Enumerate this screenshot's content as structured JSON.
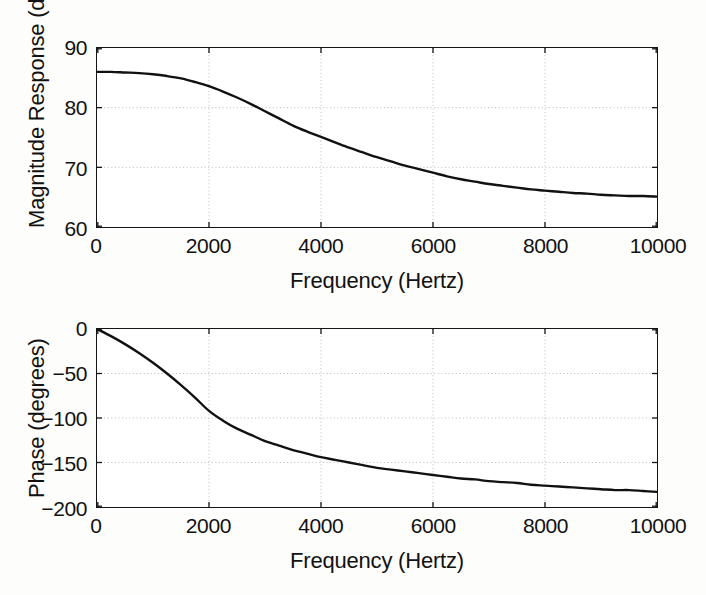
{
  "figure": {
    "background_color": "#fdfdfc",
    "axes_color": "#141414",
    "grid_color": "#b9b9b9",
    "curve_color": "#111111"
  },
  "chart_data": [
    {
      "type": "line",
      "id": "magnitude-response",
      "title": "",
      "xlabel": "Frequency (Hertz)",
      "ylabel": "Magnitude Response (dB)",
      "xlim": [
        0,
        10000
      ],
      "ylim": [
        60,
        90
      ],
      "xticks": [
        0,
        2000,
        4000,
        6000,
        8000,
        10000
      ],
      "xticklabels": [
        "0",
        "2000",
        "4000",
        "6000",
        "8000",
        "10000"
      ],
      "yticks": [
        60,
        70,
        80,
        90
      ],
      "yticklabels": [
        "60",
        "70",
        "80",
        "90"
      ],
      "grid": true,
      "legend": null,
      "series": [
        {
          "name": "Magnitude Response",
          "x": [
            0,
            250,
            500,
            750,
            1000,
            1250,
            1500,
            1750,
            2000,
            2250,
            2500,
            2750,
            3000,
            3250,
            3500,
            3750,
            4000,
            4250,
            4500,
            4750,
            5000,
            5250,
            5500,
            5750,
            6000,
            6250,
            6500,
            6750,
            7000,
            7250,
            7500,
            7750,
            8000,
            8250,
            8500,
            8750,
            9000,
            9250,
            9500,
            9750,
            10000
          ],
          "values": [
            86.0,
            86.0,
            85.9,
            85.8,
            85.6,
            85.3,
            84.9,
            84.3,
            83.6,
            82.7,
            81.7,
            80.6,
            79.4,
            78.2,
            77.0,
            76.0,
            75.1,
            74.2,
            73.3,
            72.5,
            71.7,
            71.0,
            70.3,
            69.7,
            69.1,
            68.5,
            68.0,
            67.6,
            67.2,
            66.9,
            66.6,
            66.3,
            66.1,
            65.9,
            65.7,
            65.6,
            65.4,
            65.3,
            65.2,
            65.2,
            65.1
          ]
        }
      ]
    },
    {
      "type": "line",
      "id": "phase-response",
      "title": "",
      "xlabel": "Frequency (Hertz)",
      "ylabel": "Phase (degrees)",
      "xlim": [
        0,
        10000
      ],
      "ylim": [
        -200,
        0
      ],
      "xticks": [
        0,
        2000,
        4000,
        6000,
        8000,
        10000
      ],
      "xticklabels": [
        "0",
        "2000",
        "4000",
        "6000",
        "8000",
        "10000"
      ],
      "yticks": [
        -200,
        -150,
        -100,
        -50,
        0
      ],
      "yticklabels": [
        "−200",
        "−150",
        "−100",
        "−50",
        "0"
      ],
      "grid": true,
      "legend": null,
      "series": [
        {
          "name": "Phase",
          "x": [
            0,
            250,
            500,
            750,
            1000,
            1250,
            1500,
            1750,
            2000,
            2250,
            2500,
            2750,
            3000,
            3250,
            3500,
            3750,
            4000,
            4250,
            4500,
            4750,
            5000,
            5250,
            5500,
            5750,
            6000,
            6250,
            6500,
            6750,
            7000,
            7250,
            7500,
            7750,
            8000,
            8250,
            8500,
            8750,
            9000,
            9250,
            9500,
            9750,
            10000
          ],
          "values": [
            0,
            -8,
            -17,
            -27,
            -38,
            -50,
            -63,
            -77,
            -92,
            -103,
            -112,
            -119,
            -126,
            -131,
            -136,
            -140,
            -144,
            -147,
            -150,
            -153,
            -156,
            -158,
            -160,
            -162,
            -164,
            -166,
            -168,
            -169,
            -171,
            -172,
            -173,
            -175,
            -176,
            -177,
            -178,
            -179,
            -180,
            -181,
            -181,
            -182,
            -183
          ]
        }
      ]
    }
  ]
}
